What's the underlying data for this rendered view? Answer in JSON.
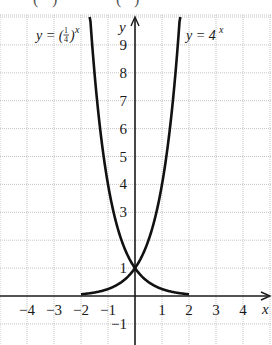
{
  "chart_data": {
    "type": "line",
    "title": "",
    "xlabel": "x",
    "ylabel": "y",
    "xlim": [
      -4.9,
      4.9
    ],
    "ylim": [
      -1.75,
      10.2
    ],
    "grid": true,
    "x_ticks": [
      -4,
      -3,
      -2,
      -1,
      1,
      2,
      3,
      4
    ],
    "x_tick_labels": [
      "−4",
      "−3",
      "−2",
      "−1",
      "1",
      "2",
      "3",
      "4"
    ],
    "y_ticks": [
      -1,
      1,
      3,
      4,
      5,
      6,
      7,
      8,
      9
    ],
    "y_tick_labels": [
      "−1",
      "1",
      "3",
      "4",
      "5",
      "6",
      "7",
      "8",
      "9"
    ],
    "series": [
      {
        "name": "y = (1/4)^x",
        "label": "y = (¼)ˣ",
        "formula": "(1/4)^x",
        "domain": [
          -1.68,
          2
        ],
        "x": [
          -1.68,
          -1.5,
          -1,
          -0.5,
          0,
          0.5,
          1,
          1.5,
          2
        ],
        "values": [
          10.26,
          8,
          4,
          2,
          1,
          0.5,
          0.25,
          0.125,
          0.0625
        ]
      },
      {
        "name": "y = 4^x",
        "label": "y = 4ˣ",
        "formula": "4^x",
        "domain": [
          -2,
          1.68
        ],
        "x": [
          -2,
          -1.5,
          -1,
          -0.5,
          0,
          0.5,
          1,
          1.5,
          1.68
        ],
        "values": [
          0.0625,
          0.125,
          0.25,
          0.5,
          1,
          2,
          4,
          8,
          10.26
        ]
      }
    ],
    "annotations": [
      {
        "text": "y = (¼)ˣ",
        "x": -3,
        "y": 9.7
      },
      {
        "text": "y = 4ˣ",
        "x": 2.6,
        "y": 9.7
      }
    ],
    "intersection": {
      "x": 0,
      "y": 1
    }
  },
  "labels": {
    "x_axis": "x",
    "y_axis": "y",
    "eq_left_prefix": "y = (",
    "eq_left_num": "1",
    "eq_left_den": "4",
    "eq_left_suffix": ")",
    "eq_left_exp": "x",
    "eq_right_prefix": "y = 4",
    "eq_right_exp": "x"
  }
}
